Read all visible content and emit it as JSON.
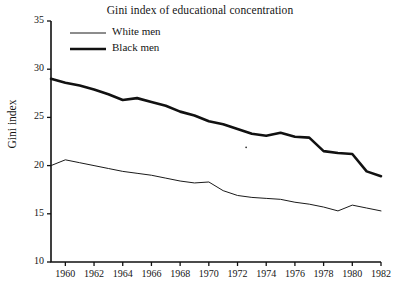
{
  "chart_data": {
    "type": "line",
    "title": "Gini index of educational concentration",
    "xlabel": "",
    "ylabel": "Gini index",
    "xlim": [
      1959,
      1982
    ],
    "ylim": [
      10,
      35
    ],
    "grid": false,
    "legend_position": "upper left inside axes",
    "yticks": [
      10,
      15,
      20,
      25,
      30,
      35
    ],
    "ytick_labels": [
      "10",
      "15",
      "20",
      "25",
      "30",
      "35"
    ],
    "xticks": [
      1960,
      1962,
      1964,
      1966,
      1968,
      1970,
      1972,
      1974,
      1976,
      1978,
      1980,
      1982
    ],
    "xtick_labels": [
      "1960",
      "1962",
      "1964",
      "1966",
      "1968",
      "1970",
      "1972",
      "1974",
      "1976",
      "1978",
      "1980",
      "1982"
    ],
    "x": [
      1959,
      1960,
      1961,
      1962,
      1963,
      1964,
      1965,
      1966,
      1967,
      1968,
      1969,
      1970,
      1971,
      1972,
      1973,
      1974,
      1975,
      1976,
      1977,
      1978,
      1979,
      1980,
      1981,
      1982
    ],
    "series": [
      {
        "name": "White men",
        "style": "thin",
        "color": "#1a1a1a",
        "linewidth": 1,
        "values": [
          20.0,
          20.6,
          20.3,
          20.0,
          19.7,
          19.4,
          19.2,
          19.0,
          18.7,
          18.4,
          18.2,
          18.3,
          17.4,
          16.9,
          16.7,
          16.6,
          16.5,
          16.2,
          16.0,
          15.7,
          15.3,
          15.9,
          15.6,
          15.3
        ]
      },
      {
        "name": "Black men",
        "style": "thick",
        "color": "#111111",
        "linewidth": 2.6,
        "values": [
          29.0,
          28.6,
          28.3,
          27.9,
          27.4,
          26.8,
          27.0,
          26.6,
          26.2,
          25.6,
          25.2,
          24.6,
          24.3,
          23.8,
          23.3,
          23.1,
          23.4,
          23.0,
          22.9,
          21.5,
          21.3,
          21.2,
          19.4,
          18.9
        ]
      }
    ],
    "annotations": [
      {
        "name": "stray-dot",
        "x": 1972.6,
        "y": 21.9
      }
    ]
  },
  "legend": {
    "items": [
      {
        "label": "White men"
      },
      {
        "label": "Black men"
      }
    ]
  }
}
